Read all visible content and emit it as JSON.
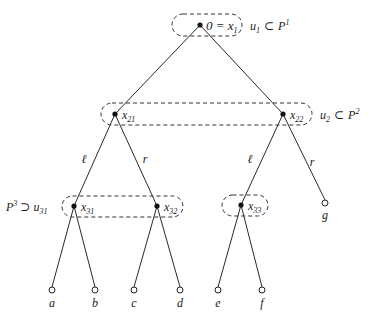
{
  "diagram": {
    "type": "game-tree",
    "nodes": {
      "root": {
        "label": "0 = x",
        "sub": "1",
        "x": 200,
        "y": 25
      },
      "x21": {
        "label": "x",
        "sub": "21",
        "x": 115,
        "y": 114
      },
      "x22": {
        "label": "x",
        "sub": "22",
        "x": 283,
        "y": 114
      },
      "x31": {
        "label": "x",
        "sub": "31",
        "x": 74,
        "y": 206
      },
      "x32": {
        "label": "x",
        "sub": "32",
        "x": 157,
        "y": 206
      },
      "x33": {
        "label": "x",
        "sub": "33",
        "x": 241,
        "y": 205
      }
    },
    "leaves": [
      {
        "label": "a",
        "x": 52,
        "y": 290
      },
      {
        "label": "b",
        "x": 95,
        "y": 290
      },
      {
        "label": "c",
        "x": 134,
        "y": 290
      },
      {
        "label": "d",
        "x": 180,
        "y": 290
      },
      {
        "label": "e",
        "x": 218,
        "y": 290
      },
      {
        "label": "f",
        "x": 262,
        "y": 290
      },
      {
        "label": "g",
        "x": 325,
        "y": 203
      }
    ],
    "edge_labels": [
      {
        "text": "ℓ",
        "x": 84,
        "y": 163
      },
      {
        "text": "r",
        "x": 145,
        "y": 163
      },
      {
        "text": "ℓ",
        "x": 250,
        "y": 163
      },
      {
        "text": "r",
        "x": 312,
        "y": 166
      }
    ],
    "information_sets": [
      {
        "name": "u1",
        "label_u": "u",
        "label_u_sub": "1",
        "relation": "⊂",
        "label_P": "P",
        "label_P_sup": "1"
      },
      {
        "name": "u2",
        "label_u": "u",
        "label_u_sub": "2",
        "relation": "⊂",
        "label_P": "P",
        "label_P_sup": "2"
      },
      {
        "name": "u31",
        "label_P": "P",
        "label_P_sup": "3",
        "relation": "⊃",
        "label_u": "u",
        "label_u_sub": "31"
      },
      {
        "name": "u33"
      }
    ]
  }
}
